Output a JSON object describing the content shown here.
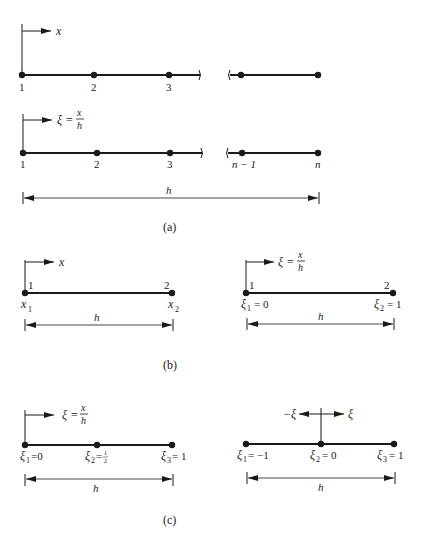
{
  "figure": {
    "panels": [
      {
        "id": "a",
        "caption": "(a)",
        "meshes": [
          {
            "axis_label": "x",
            "node_labels": [
              "1",
              "2",
              "3"
            ],
            "tail_nodes": 2
          },
          {
            "axis_label_prefix": "ξ =",
            "axis_frac_num": "x",
            "axis_frac_den": "h",
            "node_labels": [
              "1",
              "2",
              "3",
              "n − 1",
              "n"
            ]
          }
        ],
        "dimension_label": "h"
      },
      {
        "id": "b",
        "caption": "(b)",
        "left": {
          "axis_label": "x",
          "node_top_labels": [
            "1",
            "2"
          ],
          "node_bottom_labels": [
            "x",
            "x"
          ],
          "node_bottom_subs": [
            "1",
            "2"
          ],
          "dimension_label": "h"
        },
        "right": {
          "axis_label_prefix": "ξ =",
          "axis_frac_num": "x",
          "axis_frac_den": "h",
          "node_top_labels": [
            "1",
            "2"
          ],
          "node_bottom_labels": [
            "ξ",
            "ξ"
          ],
          "node_bottom_subs": [
            "1",
            "2"
          ],
          "node_bottom_values": [
            "= 0",
            "= 1"
          ],
          "dimension_label": "h"
        }
      },
      {
        "id": "c",
        "caption": "(c)",
        "left": {
          "axis_label_prefix": "ξ =",
          "axis_frac_num": "x",
          "axis_frac_den": "h",
          "node_labels": [
            "ξ",
            "ξ",
            "ξ"
          ],
          "node_subs": [
            "1",
            "2",
            "3"
          ],
          "node_values": [
            "=0",
            "=",
            "= 1"
          ],
          "half_num": "1",
          "half_den": "2",
          "dimension_label": "h"
        },
        "right": {
          "axis_neg_label": "−ξ",
          "axis_pos_label": "ξ",
          "node_labels": [
            "ξ",
            "ξ",
            "ξ"
          ],
          "node_subs": [
            "1",
            "2",
            "3"
          ],
          "node_values": [
            "= −1",
            "= 0",
            "= 1"
          ],
          "dimension_label": "h"
        }
      }
    ]
  }
}
